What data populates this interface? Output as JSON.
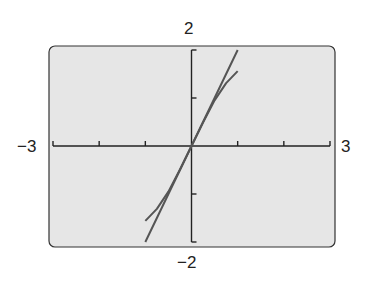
{
  "chart_data": {
    "type": "line",
    "title": "",
    "xlabel": "",
    "ylabel": "",
    "xlim": [
      -3,
      3
    ],
    "ylim": [
      -2,
      2
    ],
    "x_ticks": [
      -3,
      -2,
      -1,
      0,
      1,
      2,
      3
    ],
    "y_ticks": [
      -2,
      -1,
      0,
      1,
      2
    ],
    "window_labels": {
      "xmin": "−3",
      "xmax": "3",
      "ymin": "−2",
      "ymax": "2"
    },
    "grid": false,
    "legend": null,
    "series": [
      {
        "name": "line",
        "color": "#555555",
        "x": [
          -1,
          -0.5,
          0,
          0.5,
          1
        ],
        "y": [
          -2,
          -1,
          0,
          1,
          2
        ]
      },
      {
        "name": "curve",
        "color": "#555555",
        "x": [
          -1,
          -0.75,
          -0.5,
          -0.25,
          0,
          0.25,
          0.5,
          0.75,
          1
        ],
        "y": [
          -1.56,
          -1.31,
          -0.95,
          -0.49,
          0,
          0.49,
          0.95,
          1.31,
          1.56
        ]
      }
    ]
  },
  "colors": {
    "panel": "#e6e6e6",
    "axis": "#222222",
    "curve": "#555555"
  }
}
